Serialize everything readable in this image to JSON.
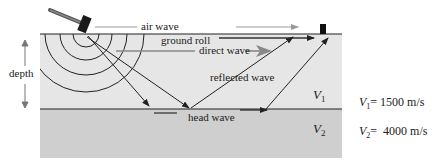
{
  "labels": {
    "air_wave": "air wave",
    "ground_roll": "ground roll",
    "direct_wave": "direct wave",
    "reflected_wave": "reflected wave",
    "head_wave": "head wave",
    "depth": "depth"
  },
  "layers": [
    {
      "symbol": "V",
      "subscript": "1",
      "color": "#e6e6e6"
    },
    {
      "symbol": "V",
      "subscript": "2",
      "color": "#cfcfcf"
    }
  ],
  "velocities": [
    {
      "symbol": "V",
      "subscript": "1",
      "value": "= 1500 m/s"
    },
    {
      "symbol": "V",
      "subscript": "2",
      "value": "=  4000 m/s"
    }
  ],
  "icons": {
    "source": "hammer-icon",
    "receiver": "geophone-icon"
  },
  "colors": {
    "line": "#222222",
    "arrow_gray": "#888888"
  }
}
